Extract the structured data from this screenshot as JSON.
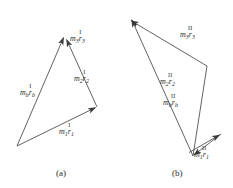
{
  "figure": {
    "background": "#ffffff",
    "stroke_color": "#3a3a3a",
    "text_color": "#2b2b2b",
    "panels": [
      {
        "id": "a",
        "caption": "(a)",
        "caption_x": 56,
        "caption_y": 168,
        "type": "vector-triangle",
        "vectors": [
          {
            "name": "m1r1",
            "m": "m",
            "sub_m": "1",
            "r": "r",
            "sub_r": "1",
            "superscript": "I",
            "from": [
              17,
              146
            ],
            "to": [
              97,
              107
            ],
            "label_x": 59,
            "label_y": 123
          },
          {
            "name": "m2r2",
            "m": "m",
            "sub_m": "2",
            "r": "r",
            "sub_r": "2",
            "superscript": "I",
            "from": [
              97,
              107
            ],
            "to": [
              66,
              38
            ],
            "label_x": 74,
            "label_y": 70
          },
          {
            "name": "mbrb",
            "m": "m",
            "sub_m": "b",
            "r": "r",
            "sub_r": "b",
            "superscript": "I",
            "from": [
              17,
              146
            ],
            "to": [
              63,
              36
            ],
            "label_x": 20,
            "label_y": 84
          },
          {
            "name": "m3r3",
            "m": "m",
            "sub_m": "3",
            "r": "r",
            "sub_r": "3",
            "superscript": "I",
            "label_x": 70,
            "label_y": 30
          }
        ]
      },
      {
        "id": "b",
        "caption": "(b)",
        "caption_x": 172,
        "caption_y": 168,
        "type": "vector-zigzag",
        "vectors": [
          {
            "name": "m1r1",
            "m": "m",
            "sub_m": "1",
            "r": "r",
            "sub_r": "1",
            "superscript": "II",
            "from": [
              189,
              152
            ],
            "to": [
              221,
              134
            ],
            "label_x": 194,
            "label_y": 146
          },
          {
            "name": "m2r2",
            "m": "m",
            "sub_m": "2",
            "r": "r",
            "sub_r": "2",
            "superscript": "II",
            "from": [
              221,
              134
            ],
            "to": [
              193,
              156
            ],
            "label_x": 160,
            "label_y": 73
          },
          {
            "name": "mbrb",
            "m": "m",
            "sub_m": "b",
            "r": "r",
            "sub_r": "b",
            "superscript": "II",
            "from": [
              193,
              156
            ],
            "to": [
              131,
              18
            ],
            "label_x": 163,
            "label_y": 94
          },
          {
            "name": "m3r3",
            "m": "m",
            "sub_m": "3",
            "r": "r",
            "sub_r": "3",
            "superscript": "II",
            "from": [
              207,
              66
            ],
            "to": [
              130,
              20
            ],
            "label_x": 180,
            "label_y": 26
          }
        ]
      }
    ]
  }
}
